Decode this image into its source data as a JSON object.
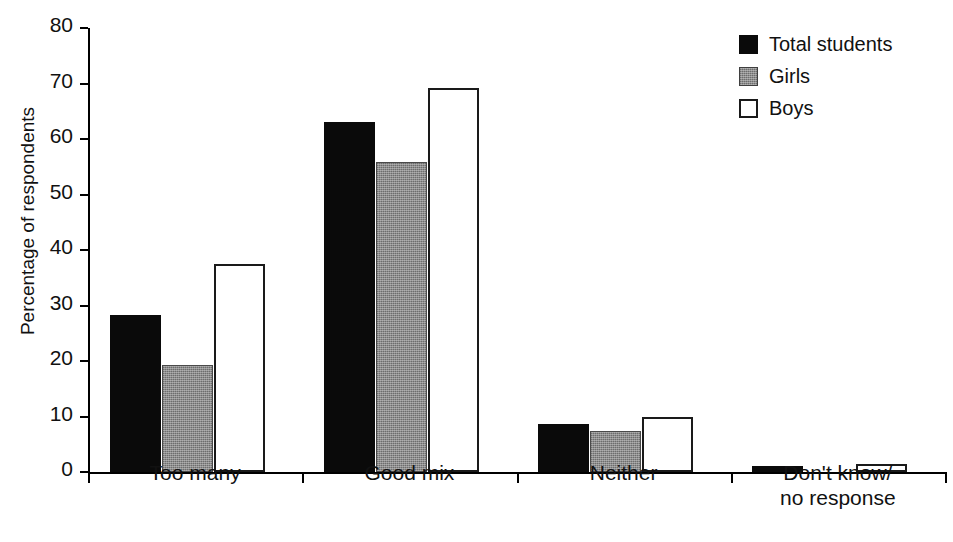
{
  "chart_data": {
    "type": "bar",
    "title": "",
    "xlabel": "",
    "ylabel": "Percentage of respondents",
    "ylim": [
      0,
      80
    ],
    "yticks": [
      0,
      10,
      20,
      30,
      40,
      50,
      60,
      70,
      80
    ],
    "ytick_labels": [
      "0",
      "10",
      "20",
      "30",
      "40",
      "50",
      "60",
      "70",
      "80"
    ],
    "grid": false,
    "legend_position": "top-right",
    "categories": [
      "Too many",
      "Good mix",
      "Neither",
      "Don't know/\nno response"
    ],
    "category_labels": [
      "Too many",
      "Good mix",
      "Neither",
      "Don't know/\nno response"
    ],
    "series": [
      {
        "name": "Total students",
        "color": "#0a0a0a",
        "fill": "solid-black",
        "values": [
          28.3,
          63.0,
          8.7,
          1.0
        ]
      },
      {
        "name": "Girls",
        "color": "#8c8c8c",
        "fill": "gray-stipple",
        "values": [
          19.2,
          55.8,
          7.4,
          0.0
        ]
      },
      {
        "name": "Boys",
        "color": "#ffffff",
        "fill": "white-outline",
        "values": [
          37.5,
          69.1,
          9.9,
          1.4
        ]
      }
    ]
  },
  "legend": {
    "entries": [
      {
        "label": "Total students",
        "swatch": "total"
      },
      {
        "label": "Girls",
        "swatch": "girls"
      },
      {
        "label": "Boys",
        "swatch": "boys"
      }
    ]
  },
  "axes": {
    "y_title": "Percentage of respondents"
  }
}
